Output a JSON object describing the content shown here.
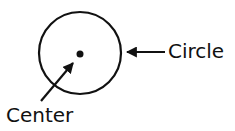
{
  "diagram": {
    "title": "",
    "labels": {
      "circle": "Circle",
      "center": "Center"
    },
    "colors": {
      "stroke": "#111111",
      "background": "#ffffff"
    }
  }
}
